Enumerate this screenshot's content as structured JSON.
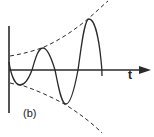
{
  "figure": {
    "panel_label": "(b)",
    "x_axis_label": "t"
  },
  "colors": {
    "stroke": "#2a2a2a",
    "background": "#ffffff"
  }
}
